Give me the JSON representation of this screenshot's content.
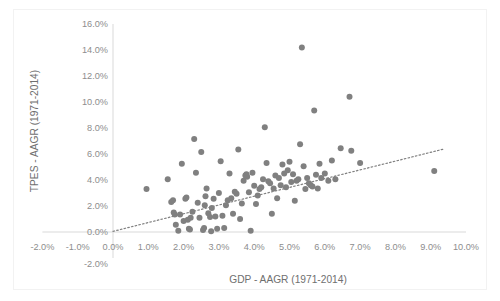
{
  "chart_data": {
    "type": "scatter",
    "title": "",
    "xlabel": "GDP - AAGR (1971-2014)",
    "ylabel": "TPES - AAGR (1971-2014)",
    "xlim": [
      -2.0,
      10.0
    ],
    "ylim": [
      -2.0,
      16.0
    ],
    "x_tick_labels": [
      "-2.0%",
      "-1.0%",
      "0.0%",
      "1.0%",
      "2.0%",
      "3.0%",
      "4.0%",
      "5.0%",
      "6.0%",
      "7.0%",
      "8.0%",
      "9.0%",
      "10.0%"
    ],
    "x_tick_values": [
      -2.0,
      -1.0,
      0.0,
      1.0,
      2.0,
      3.0,
      4.0,
      5.0,
      6.0,
      7.0,
      8.0,
      9.0,
      10.0
    ],
    "y_tick_labels": [
      "-2.0%",
      "0.0%",
      "2.0%",
      "4.0%",
      "6.0%",
      "8.0%",
      "10.0%",
      "12.0%",
      "14.0%",
      "16.0%"
    ],
    "y_tick_values": [
      -2.0,
      0.0,
      2.0,
      4.0,
      6.0,
      8.0,
      10.0,
      12.0,
      14.0,
      16.0
    ],
    "grid": false,
    "legend": "none",
    "marker_color": "#808080",
    "marker_size": 3.0,
    "trendline": {
      "style": "dotted",
      "color": "#808080",
      "x_start": 0.0,
      "y_start": 0.05,
      "x_end": 9.4,
      "y_end": 6.4
    },
    "series": [
      {
        "name": "Countries",
        "points": [
          [
            0.95,
            3.3
          ],
          [
            1.55,
            4.05
          ],
          [
            1.65,
            2.3
          ],
          [
            1.7,
            2.45
          ],
          [
            1.72,
            1.5
          ],
          [
            1.75,
            1.35
          ],
          [
            1.78,
            0.55
          ],
          [
            1.85,
            0.1
          ],
          [
            1.9,
            1.35
          ],
          [
            1.95,
            5.25
          ],
          [
            2.0,
            0.85
          ],
          [
            2.05,
            2.55
          ],
          [
            2.08,
            2.65
          ],
          [
            2.12,
            0.95
          ],
          [
            2.15,
            0.25
          ],
          [
            2.18,
            0.2
          ],
          [
            2.2,
            1.1
          ],
          [
            2.25,
            1.55
          ],
          [
            2.3,
            7.15
          ],
          [
            2.35,
            4.55
          ],
          [
            2.4,
            2.25
          ],
          [
            2.45,
            1.1
          ],
          [
            2.5,
            6.15
          ],
          [
            2.55,
            0.15
          ],
          [
            2.58,
            0.3
          ],
          [
            2.6,
            2.05
          ],
          [
            2.62,
            2.75
          ],
          [
            2.65,
            3.35
          ],
          [
            2.7,
            1.45
          ],
          [
            2.75,
            1.15
          ],
          [
            2.78,
            0.05
          ],
          [
            2.8,
            1.85
          ],
          [
            2.85,
            2.55
          ],
          [
            2.9,
            1.2
          ],
          [
            2.95,
            0.25
          ],
          [
            3.0,
            3.0
          ],
          [
            3.05,
            5.45
          ],
          [
            3.1,
            1.25
          ],
          [
            3.15,
            0.3
          ],
          [
            3.2,
            2.05
          ],
          [
            3.25,
            2.45
          ],
          [
            3.3,
            4.5
          ],
          [
            3.35,
            2.6
          ],
          [
            3.4,
            1.4
          ],
          [
            3.45,
            3.1
          ],
          [
            3.5,
            2.95
          ],
          [
            3.55,
            6.35
          ],
          [
            3.6,
            1.0
          ],
          [
            3.65,
            2.2
          ],
          [
            3.7,
            3.95
          ],
          [
            3.75,
            4.35
          ],
          [
            3.78,
            4.45
          ],
          [
            3.8,
            4.25
          ],
          [
            3.85,
            3.05
          ],
          [
            3.9,
            0.1
          ],
          [
            3.95,
            4.55
          ],
          [
            4.0,
            3.55
          ],
          [
            4.05,
            2.15
          ],
          [
            4.1,
            2.8
          ],
          [
            4.15,
            3.3
          ],
          [
            4.2,
            3.45
          ],
          [
            4.25,
            4.05
          ],
          [
            4.3,
            8.05
          ],
          [
            4.35,
            5.3
          ],
          [
            4.4,
            3.9
          ],
          [
            4.45,
            3.75
          ],
          [
            4.5,
            1.4
          ],
          [
            4.55,
            3.35
          ],
          [
            4.6,
            4.35
          ],
          [
            4.65,
            2.6
          ],
          [
            4.7,
            4.15
          ],
          [
            4.75,
            3.6
          ],
          [
            4.8,
            5.2
          ],
          [
            4.85,
            4.5
          ],
          [
            4.9,
            3.45
          ],
          [
            4.95,
            4.75
          ],
          [
            5.0,
            5.4
          ],
          [
            5.05,
            3.85
          ],
          [
            5.1,
            4.45
          ],
          [
            5.15,
            2.4
          ],
          [
            5.2,
            3.95
          ],
          [
            5.25,
            4.05
          ],
          [
            5.3,
            6.75
          ],
          [
            5.35,
            14.2
          ],
          [
            5.4,
            5.05
          ],
          [
            5.45,
            3.3
          ],
          [
            5.5,
            4.15
          ],
          [
            5.55,
            3.75
          ],
          [
            5.6,
            3.6
          ],
          [
            5.65,
            3.5
          ],
          [
            5.7,
            9.35
          ],
          [
            5.75,
            4.4
          ],
          [
            5.8,
            3.35
          ],
          [
            5.85,
            5.25
          ],
          [
            5.9,
            4.15
          ],
          [
            6.0,
            4.5
          ],
          [
            6.1,
            3.95
          ],
          [
            6.2,
            5.5
          ],
          [
            6.3,
            4.05
          ],
          [
            6.45,
            6.45
          ],
          [
            6.7,
            10.4
          ],
          [
            6.75,
            6.25
          ],
          [
            7.0,
            5.3
          ],
          [
            9.1,
            4.7
          ]
        ]
      }
    ]
  }
}
